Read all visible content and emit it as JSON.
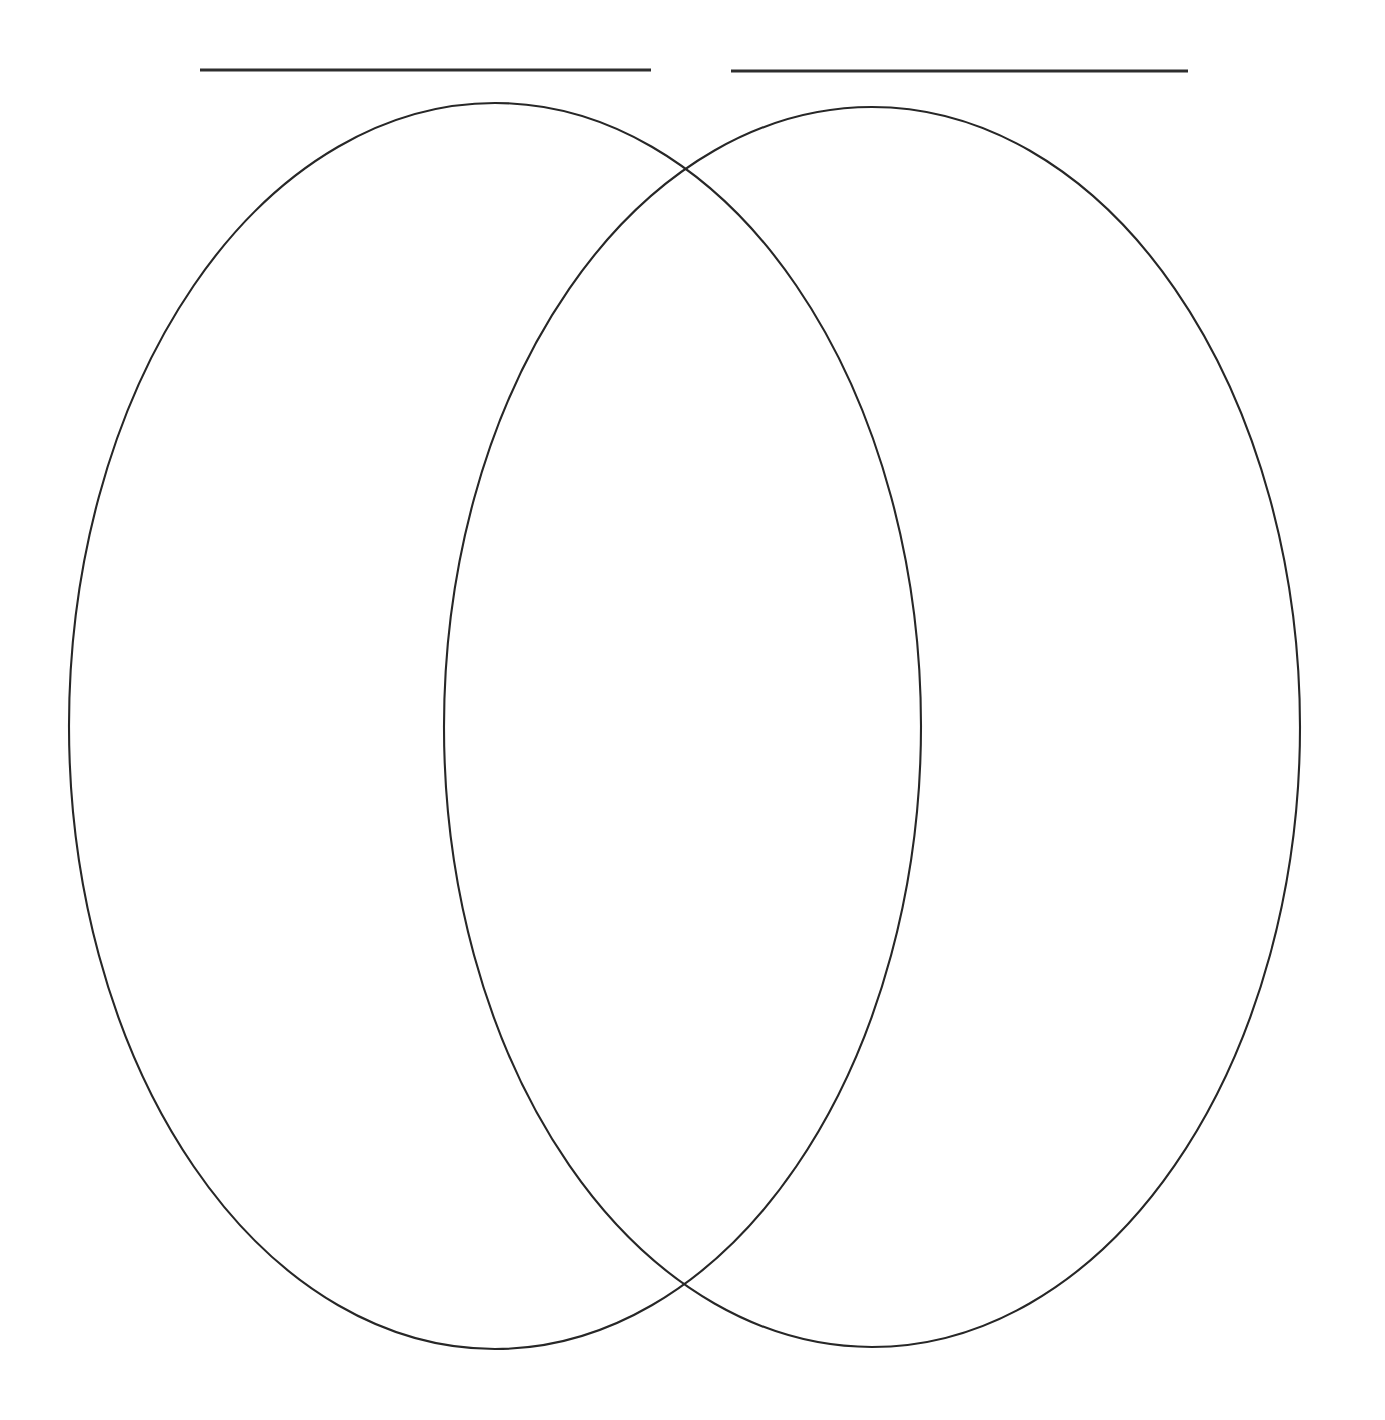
{
  "document": {
    "kind": "venn-diagram-worksheet",
    "title": "",
    "background_color": "#ffffff",
    "width": 1385,
    "height": 1420
  },
  "colors": {
    "ink": "#272727",
    "rule_ink": "#2e2e2e",
    "page": "#ffffff"
  },
  "label_rules": [
    {
      "name": "left-title-rule",
      "value": "",
      "placeholder": "",
      "x1": 200,
      "y1": 70,
      "x2": 651,
      "y2": 70,
      "thickness": 3
    },
    {
      "name": "right-title-rule",
      "value": "",
      "placeholder": "",
      "x1": 731,
      "y1": 71,
      "x2": 1188,
      "y2": 71,
      "thickness": 3
    }
  ],
  "ellipses": [
    {
      "name": "left-circle",
      "label": "",
      "cx": 495,
      "cy": 726,
      "rx": 426,
      "ry": 623,
      "stroke": "#272727",
      "stroke_width": 2,
      "fill": "none"
    },
    {
      "name": "right-circle",
      "label": "",
      "cx": 872,
      "cy": 727,
      "rx": 428,
      "ry": 620,
      "stroke": "#272727",
      "stroke_width": 2,
      "fill": "none"
    }
  ],
  "regions": [
    {
      "name": "left-only-region",
      "label": "",
      "placeholder": "",
      "center_x": 280,
      "center_y": 726
    },
    {
      "name": "intersection-region",
      "label": "",
      "placeholder": "",
      "center_x": 684,
      "center_y": 729
    },
    {
      "name": "right-only-region",
      "label": "",
      "placeholder": "",
      "center_x": 1095,
      "center_y": 727
    }
  ],
  "intersection_points": [
    {
      "name": "upper-intersection",
      "x": 686,
      "y": 168
    },
    {
      "name": "lower-intersection",
      "x": 683,
      "y": 1290
    }
  ],
  "chart_data": {
    "type": "diagram",
    "diagram_type": "venn",
    "set_count": 2,
    "title": "",
    "sets": [
      {
        "name": "left-set",
        "label": "",
        "items": []
      },
      {
        "name": "right-set",
        "label": "",
        "items": []
      }
    ],
    "overlap_items": [],
    "filled": false
  }
}
